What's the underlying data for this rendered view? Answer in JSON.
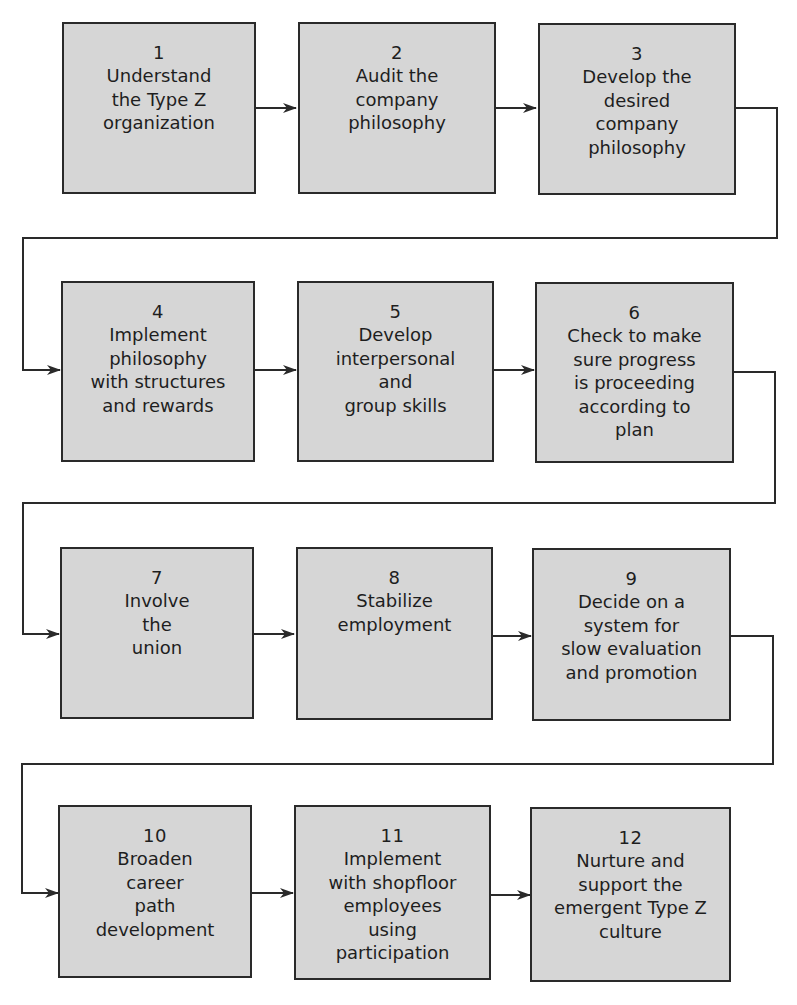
{
  "diagram": {
    "title": "",
    "steps": [
      {
        "number": "1",
        "text": "Understand\nthe Type Z\norganization"
      },
      {
        "number": "2",
        "text": "Audit the\ncompany\nphilosophy"
      },
      {
        "number": "3",
        "text": "Develop the\ndesired\ncompany\nphilosophy"
      },
      {
        "number": "4",
        "text": "Implement\nphilosophy\nwith structures\nand rewards"
      },
      {
        "number": "5",
        "text": "Develop\ninterpersonal\nand\ngroup skills"
      },
      {
        "number": "6",
        "text": "Check to make\nsure progress\nis proceeding\naccording to\nplan"
      },
      {
        "number": "7",
        "text": "Involve\nthe\nunion"
      },
      {
        "number": "8",
        "text": "Stabilize\nemployment"
      },
      {
        "number": "9",
        "text": "Decide on a\nsystem for\nslow evaluation\nand promotion"
      },
      {
        "number": "10",
        "text": "Broaden\ncareer\npath\ndevelopment"
      },
      {
        "number": "11",
        "text": "Implement\nwith shopfloor\nemployees\nusing\nparticipation"
      },
      {
        "number": "12",
        "text": "Nurture and\nsupport the\nemergent Type Z\nculture"
      }
    ],
    "flow": "1→2→3→4→5→6→7→8→9→10→11→12",
    "colors": {
      "box_fill": "#d6d6d6",
      "box_border": "#2a2a2a",
      "line": "#2a2a2a",
      "background": "#ffffff"
    }
  }
}
